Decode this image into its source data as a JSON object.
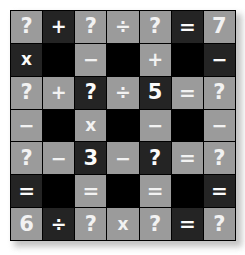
{
  "puzzle": {
    "title": "Math grid puzzle",
    "rows": 7,
    "columns": 7,
    "colors": {
      "background": "#ffffff",
      "cell_light": "#9b9b9b",
      "cell_dark": "#242424",
      "cell_black": "#000000",
      "glyph": "#f6f6f6",
      "gridline": "#000000",
      "shadow": "#b9b9b9"
    },
    "known_numbers": [
      "7",
      "5",
      "3",
      "6"
    ],
    "unknown_symbol": "?",
    "operators_used": [
      "+",
      "÷",
      "=",
      "x",
      "−"
    ],
    "cells": [
      [
        {
          "text": "?",
          "tone": "light",
          "kind": "value",
          "name": "cell-r1c1"
        },
        {
          "text": "+",
          "tone": "dark",
          "kind": "op",
          "name": "cell-r1c2"
        },
        {
          "text": "?",
          "tone": "light",
          "kind": "value",
          "name": "cell-r1c3"
        },
        {
          "text": "÷",
          "tone": "light",
          "kind": "op",
          "name": "cell-r1c4"
        },
        {
          "text": "?",
          "tone": "light",
          "kind": "value",
          "name": "cell-r1c5"
        },
        {
          "text": "=",
          "tone": "dark",
          "kind": "op",
          "name": "cell-r1c6"
        },
        {
          "text": "7",
          "tone": "light",
          "kind": "value",
          "name": "cell-r1c7"
        }
      ],
      [
        {
          "text": "x",
          "tone": "dark",
          "kind": "op",
          "name": "cell-r2c1"
        },
        {
          "text": "",
          "tone": "black",
          "kind": "blank",
          "name": "cell-r2c2"
        },
        {
          "text": "−",
          "tone": "light",
          "kind": "op",
          "name": "cell-r2c3"
        },
        {
          "text": "",
          "tone": "black",
          "kind": "blank",
          "name": "cell-r2c4"
        },
        {
          "text": "+",
          "tone": "light",
          "kind": "op",
          "name": "cell-r2c5"
        },
        {
          "text": "",
          "tone": "black",
          "kind": "blank",
          "name": "cell-r2c6"
        },
        {
          "text": "−",
          "tone": "dark",
          "kind": "op",
          "name": "cell-r2c7"
        }
      ],
      [
        {
          "text": "?",
          "tone": "light",
          "kind": "value",
          "name": "cell-r3c1"
        },
        {
          "text": "+",
          "tone": "light",
          "kind": "op",
          "name": "cell-r3c2"
        },
        {
          "text": "?",
          "tone": "dark",
          "kind": "value",
          "name": "cell-r3c3"
        },
        {
          "text": "÷",
          "tone": "light",
          "kind": "op",
          "name": "cell-r3c4"
        },
        {
          "text": "5",
          "tone": "dark",
          "kind": "value",
          "name": "cell-r3c5"
        },
        {
          "text": "=",
          "tone": "light",
          "kind": "op",
          "name": "cell-r3c6"
        },
        {
          "text": "?",
          "tone": "light",
          "kind": "value",
          "name": "cell-r3c7"
        }
      ],
      [
        {
          "text": "−",
          "tone": "light",
          "kind": "op",
          "name": "cell-r4c1"
        },
        {
          "text": "",
          "tone": "black",
          "kind": "blank",
          "name": "cell-r4c2"
        },
        {
          "text": "x",
          "tone": "light",
          "kind": "op",
          "name": "cell-r4c3"
        },
        {
          "text": "",
          "tone": "black",
          "kind": "blank",
          "name": "cell-r4c4"
        },
        {
          "text": "−",
          "tone": "light",
          "kind": "op",
          "name": "cell-r4c5"
        },
        {
          "text": "",
          "tone": "black",
          "kind": "blank",
          "name": "cell-r4c6"
        },
        {
          "text": "−",
          "tone": "light",
          "kind": "op",
          "name": "cell-r4c7"
        }
      ],
      [
        {
          "text": "?",
          "tone": "light",
          "kind": "value",
          "name": "cell-r5c1"
        },
        {
          "text": "−",
          "tone": "light",
          "kind": "op",
          "name": "cell-r5c2"
        },
        {
          "text": "3",
          "tone": "dark",
          "kind": "value",
          "name": "cell-r5c3"
        },
        {
          "text": "−",
          "tone": "light",
          "kind": "op",
          "name": "cell-r5c4"
        },
        {
          "text": "?",
          "tone": "dark",
          "kind": "value",
          "name": "cell-r5c5"
        },
        {
          "text": "=",
          "tone": "light",
          "kind": "op",
          "name": "cell-r5c6"
        },
        {
          "text": "?",
          "tone": "light",
          "kind": "value",
          "name": "cell-r5c7"
        }
      ],
      [
        {
          "text": "=",
          "tone": "dark",
          "kind": "op",
          "name": "cell-r6c1"
        },
        {
          "text": "",
          "tone": "black",
          "kind": "blank",
          "name": "cell-r6c2"
        },
        {
          "text": "=",
          "tone": "light",
          "kind": "op",
          "name": "cell-r6c3"
        },
        {
          "text": "",
          "tone": "black",
          "kind": "blank",
          "name": "cell-r6c4"
        },
        {
          "text": "=",
          "tone": "light",
          "kind": "op",
          "name": "cell-r6c5"
        },
        {
          "text": "",
          "tone": "black",
          "kind": "blank",
          "name": "cell-r6c6"
        },
        {
          "text": "=",
          "tone": "dark",
          "kind": "op",
          "name": "cell-r6c7"
        }
      ],
      [
        {
          "text": "6",
          "tone": "light",
          "kind": "value",
          "name": "cell-r7c1"
        },
        {
          "text": "÷",
          "tone": "dark",
          "kind": "op",
          "name": "cell-r7c2"
        },
        {
          "text": "?",
          "tone": "light",
          "kind": "value",
          "name": "cell-r7c3"
        },
        {
          "text": "x",
          "tone": "light",
          "kind": "op",
          "name": "cell-r7c4"
        },
        {
          "text": "?",
          "tone": "light",
          "kind": "value",
          "name": "cell-r7c5"
        },
        {
          "text": "=",
          "tone": "dark",
          "kind": "op",
          "name": "cell-r7c6"
        },
        {
          "text": "?",
          "tone": "light",
          "kind": "value",
          "name": "cell-r7c7"
        }
      ]
    ]
  }
}
